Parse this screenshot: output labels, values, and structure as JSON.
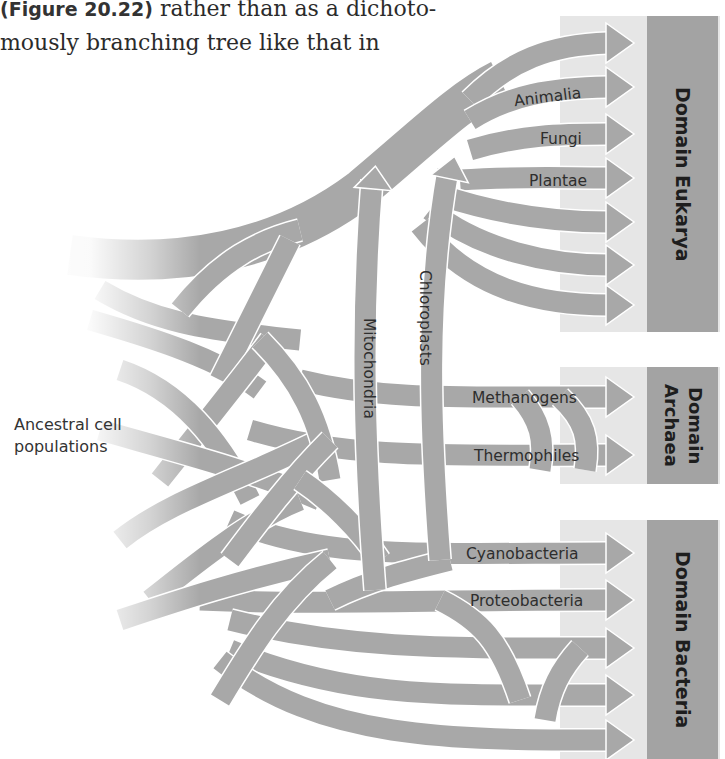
{
  "body_text": {
    "line1_ref": "(Figure 20.22)",
    "line1_rest": " rather than as a dichoto-",
    "line2": "mously branching tree like that in"
  },
  "figure": {
    "ancestral_label_line1": "Ancestral cell",
    "ancestral_label_line2": "populations",
    "transfers": [
      {
        "label": "Mitochondria"
      },
      {
        "label": "Chloroplasts"
      }
    ],
    "domains": [
      {
        "name": "Domain Eukarya",
        "lineages": [
          "",
          "Animalia",
          "Fungi",
          "Plantae",
          "",
          "",
          ""
        ]
      },
      {
        "name": "Domain Archaea",
        "lineages": [
          "Methanogens",
          "Thermophiles"
        ]
      },
      {
        "name": "Domain Bacteria",
        "lineages": [
          "Cyanobacteria",
          "Proteobacteria",
          "",
          "",
          ""
        ]
      }
    ],
    "colors": {
      "branch": "#a8a8a8",
      "band": "#e6e6e6",
      "domain_panel": "#a3a3a3",
      "text": "#2e2e2e"
    }
  }
}
